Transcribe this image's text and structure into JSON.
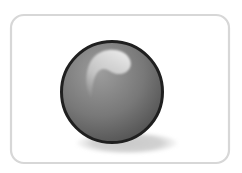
{
  "scene": {
    "description": "Clipart illustration of a glossy gray ball resting on a white rounded-rectangle card with a soft shadow",
    "card": {
      "background": "#ffffff",
      "border_color": "#d7d7d7"
    },
    "ball": {
      "top_color": "#9d9d9d",
      "base_color": "#787878",
      "bottom_color": "#4c4c4c",
      "outline_color": "#1f1f1f",
      "highlight_color": "#f2f2f2"
    },
    "shadow": {
      "color": "#c9c9c9"
    }
  }
}
